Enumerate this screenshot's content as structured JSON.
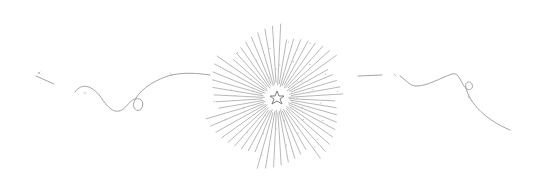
{
  "illustration": {
    "name": "starburst-divider",
    "stroke_color": "#9a9a9a",
    "star_color": "#6f6f6f",
    "center": {
      "x": 277,
      "y": 98
    },
    "ray_count": 56,
    "inner_radius": 12,
    "outer_radius": 70,
    "elements": [
      "left-flourish",
      "starburst",
      "center-star",
      "right-flourish"
    ]
  }
}
